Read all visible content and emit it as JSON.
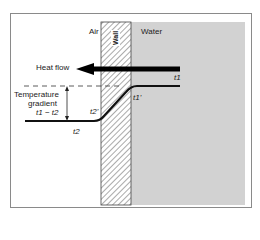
{
  "diagram": {
    "regions": {
      "air": "Air",
      "wall": "Wall",
      "water": "Water"
    },
    "arrow_label": "Heat flow",
    "gradient_label_line1": "Temperature",
    "gradient_label_line2": "gradient",
    "gradient_expression": "t1 − t2",
    "points": {
      "t1": "t1",
      "t1_prime": "t1'",
      "t2": "t2",
      "t2_prime": "t2'"
    },
    "colors": {
      "water_fill": "#d2d2d2",
      "wall_fill": "#ffffff",
      "hatch": "#555555",
      "line": "#111111",
      "frame": "#8a8a8a"
    }
  }
}
